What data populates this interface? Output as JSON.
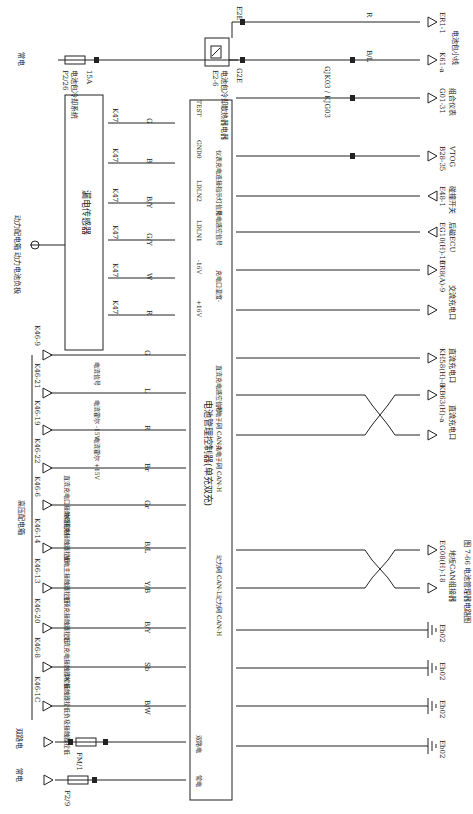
{
  "figure": {
    "caption": "图 7-66  电池管理器电路图",
    "orientation": "rotated 90° clockwise"
  },
  "power_sources": {
    "always_on_top": "常电",
    "fuse_top": {
      "id": "P2/26",
      "desc": "电池包冷却系统",
      "rating": "15A"
    },
    "always_on_bottom": "常电",
    "fuse_bottom": {
      "id": "F2/9",
      "desc": "电池管理器",
      "rating": "7.5A",
      "pin": "2",
      "connector": "E2F"
    },
    "dual_path": "双路电",
    "fuse_dual": {
      "id": "FM/1",
      "desc": "EMS",
      "rating": "15A",
      "conn_in": "R60(C)",
      "pin_in": "1",
      "conn_out": "R60(C)",
      "pin_out": "2"
    }
  },
  "relay": {
    "id": "E2-6",
    "desc": "电池包冷却散热器电器",
    "pins": [
      "86",
      "88",
      "85",
      "89"
    ],
    "out_top": {
      "pin": "16",
      "conn": "E2E"
    },
    "out_bottom": {
      "pin": "4",
      "conn": "G2E"
    }
  },
  "battery_pack_connectors": {
    "group_label": "电池包小线",
    "items": [
      {
        "wire": "R",
        "gauge": "0.5",
        "conn": "ER1-1"
      },
      {
        "wire": "B/L",
        "gauge": "0.5",
        "conn": "K61-a",
        "inline": "GJK03 / KJG03",
        "inline_pin": "21"
      }
    ],
    "b_l_upstream": {
      "wire": "B/L",
      "gauge": "0.5"
    }
  },
  "leakage_sensor": {
    "title": "漏电传感器",
    "source_label": "动力配电箱 动力电池负极",
    "pins": [
      {
        "conn": "K47",
        "pin": "6",
        "wire": "G",
        "gauge": "0.5"
      },
      {
        "conn": "K47",
        "pin": "3",
        "wire": "B",
        "gauge": "0.5"
      },
      {
        "conn": "K47",
        "pin": "2",
        "wire": "B/Y",
        "gauge": "0.5"
      },
      {
        "conn": "K47",
        "pin": "1",
        "wire": "G/Y",
        "gauge": "0.5"
      },
      {
        "conn": "K47",
        "pin": "5",
        "wire": "W",
        "gauge": "0.5"
      },
      {
        "conn": "K47",
        "pin": "4",
        "wire": "R",
        "gauge": "0.5"
      }
    ]
  },
  "hv_box": {
    "title": "高压配电箱",
    "pins": [
      {
        "conn": "K46-9",
        "desc": "电流信号",
        "wire": "G",
        "gauge": "0.5"
      },
      {
        "conn": "K46-21",
        "desc": "电流霍尔 -15V",
        "wire": "L",
        "gauge": "0.5"
      },
      {
        "conn": "K46-19",
        "desc": "电流霍尔 +15V",
        "wire": "R",
        "gauge": "0.5"
      },
      {
        "conn": "K46-22",
        "desc": "直流充电口接触器控制",
        "wire": "Br",
        "gauge": "0.5"
      },
      {
        "conn": "K46-6",
        "desc": "DC预充接触器拉低",
        "wire": "Gr",
        "gauge": "0.5"
      },
      {
        "conn": "K46-14",
        "desc": "放电主接触器拉低",
        "wire": "B/L",
        "gauge": "0.5"
      },
      {
        "conn": "K46-13",
        "desc": "主预充接触器拉低",
        "wire": "Y/B",
        "gauge": "0.5"
      },
      {
        "conn": "K46-20",
        "desc": "交流充电接触器拉低",
        "wire": "B/Y",
        "gauge": "0.5"
      },
      {
        "conn": "K46-8",
        "desc": "DC接触器拉低",
        "wire": "Sb",
        "gauge": "0.5"
      },
      {
        "conn": "K46-1C",
        "desc": "负极接触器拉低",
        "wire": "B/W",
        "gauge": "0.5"
      }
    ]
  },
  "bms": {
    "title": "电池管理控制器(单充双充)",
    "left_pins": [
      {
        "conn": "E45(A)",
        "pin": "1",
        "label": "TEST"
      },
      {
        "conn": "E45(A)",
        "pin": "19",
        "label": "GND0"
      },
      {
        "conn": "E45(A)",
        "pin": "10",
        "label": "LDLN2"
      },
      {
        "conn": "E45(A)",
        "pin": "2",
        "label": "LDLN1"
      },
      {
        "conn": "E45(A)",
        "pin": "20",
        "label": "-16V"
      },
      {
        "conn": "E45(A)",
        "pin": "19",
        "label": "+16V"
      },
      {
        "conn": "E45-A",
        "pin": "26",
        "label": ""
      },
      {
        "conn": "E45(A)",
        "pin": "29",
        "label": ""
      },
      {
        "conn": "E45(A)",
        "pin": "27",
        "label": ""
      },
      {
        "conn": "E45(A)",
        "pin": "24",
        "label": ""
      },
      {
        "conn": "E45(A)",
        "pin": "23",
        "label": ""
      },
      {
        "conn": "E45(A)",
        "pin": "9",
        "label": ""
      },
      {
        "conn": "E45(A)",
        "pin": "17",
        "label": ""
      },
      {
        "conn": "E45(A)",
        "pin": "33",
        "label": ""
      },
      {
        "conn": "E45(A)",
        "pin": "34",
        "label": ""
      },
      {
        "conn": "E45(B)",
        "pin": "28",
        "label": ""
      },
      {
        "conn": "E45(B)",
        "pin": "1",
        "label": "双路电"
      },
      {
        "conn": "E45(B)",
        "pin": "2",
        "label": "常电"
      }
    ],
    "right_pins": [
      {
        "conn": "E45(B)",
        "pin": "32",
        "label": "仪表充电连接指示灯信号",
        "wire": "L",
        "gauge": "0.5",
        "dest": "G01-31",
        "dest_desc": "组合仪表",
        "inline": "EJG03 / GJK03",
        "inline_pin": "22"
      },
      {
        "conn": "E45(B)",
        "pin": "18",
        "label": "充电感应信号",
        "wire": "Y",
        "gauge": "0.5",
        "dest": "B28-35",
        "dest_desc": "VTOG",
        "inline": "KJB01 / BJK01",
        "inline_pin": "16"
      },
      {
        "conn": "E45(B)",
        "pin": "19",
        "label": "后磁信号",
        "wire": "R",
        "gauge": "0.5",
        "dest": "E48-1",
        "dest_desc": "碰撞开关"
      },
      {
        "conn": "E45(B)",
        "pin": "26",
        "label": "充电口温度-",
        "wire": "O",
        "gauge": "0.5",
        "dest": "EG10(H)-10",
        "dest_desc": "后磁ECU"
      },
      {
        "conn": "E45(B)",
        "pin": "12",
        "label": "充电口温度+",
        "wire": "Lx",
        "gauge": "0.5",
        "dest": "ER8(A)-9",
        "dest_desc": "交流充电口"
      },
      {
        "conn": "E45(B)",
        "pin": "11",
        "label": "充电口温度+",
        "wire": "W",
        "gauge": "0.5",
        "dest": "ER8(A)-10",
        "dest_desc": "交流充电口"
      },
      {
        "conn": "E45(B)",
        "pin": "4",
        "label": "直流充电感应信号",
        "wire": "L",
        "gauge": "0.5",
        "dest": "KH58(H)-8",
        "dest_desc": "直流充电口"
      },
      {
        "conn": "E45(B)",
        "pin": "30",
        "label": "充电子网 CAN-L",
        "wire": "V",
        "gauge": "0.5",
        "dest": "KB63(H)-a",
        "dest_desc": "直流充电口"
      },
      {
        "conn": "E45(B)",
        "pin": "14",
        "label": "充电子网 CAN-H",
        "wire": "P",
        "gauge": "0.5",
        "dest": "KB63(H)-1",
        "dest_desc": "直流充电口"
      },
      {
        "conn": "E45(B)",
        "pin": "22",
        "label": "动力网 CAN-L",
        "wire": "V",
        "gauge": "0.5",
        "dest": "EG08(H)-18",
        "dest_desc": "地板CAN组接器"
      },
      {
        "conn": "E45(B)",
        "pin": "16",
        "label": "动力网 CAN-H",
        "wire": "P",
        "gauge": "0.5",
        "dest": "EG08(H)-8",
        "dest_desc": "地板CAN组接器"
      },
      {
        "conn": "E45(B)",
        "pin": "6",
        "label": "",
        "wire": "B",
        "gauge": "0.5",
        "dest": "Eb02",
        "dest_desc": "ground"
      },
      {
        "conn": "E45(B)",
        "pin": "8",
        "label": "",
        "wire": "B",
        "gauge": "0.5",
        "dest": "Eb02",
        "dest_desc": "ground"
      },
      {
        "conn": "E45(A)",
        "pin": "30",
        "label": "",
        "wire": "B",
        "gauge": "0.5",
        "dest": "Eb02",
        "dest_desc": "ground"
      },
      {
        "conn": "E45(A)",
        "pin": "28",
        "label": "",
        "wire": "B",
        "gauge": "0.5",
        "dest": "Eb02",
        "dest_desc": "ground"
      }
    ],
    "top_right_pin": {
      "conn": "E45(A)",
      "label": "E45(A)"
    }
  },
  "colors": {
    "line": "#222222",
    "background": "#ffffff"
  }
}
